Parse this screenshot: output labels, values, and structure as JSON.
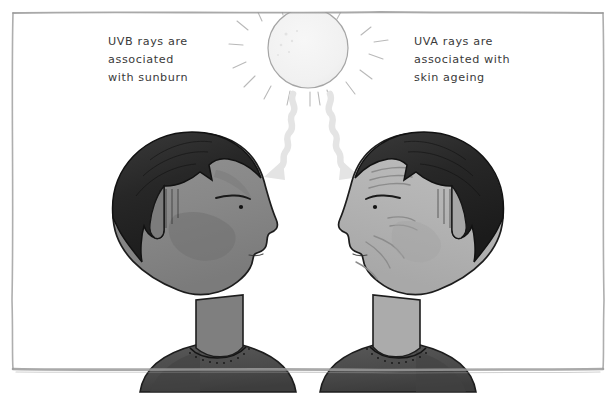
{
  "illustration": {
    "title": "UV rays and skin effects diagram",
    "background_color": "#ffffff",
    "frame": {
      "name": "hand-drawn-border",
      "color": "#9a9a9a"
    },
    "sun": {
      "name": "sun",
      "fill": "#f4f4f4",
      "outline": "#9a9a9a",
      "ray_count": 18
    },
    "uv_beams": {
      "color": "#e4e4e4",
      "count": 2
    },
    "captions": {
      "left": {
        "lines": [
          "UVB rays are",
          "associated",
          "with sunburn"
        ],
        "color": "#3a3a3a"
      },
      "right": {
        "lines": [
          "UVA rays are",
          "associated with",
          "skin ageing"
        ],
        "color": "#3a3a3a"
      }
    },
    "figures": [
      {
        "name": "left-person-sunburn",
        "facing": "right",
        "hair_color": "#2b2b2b",
        "skin_color": "#8a8a8a",
        "shirt_color": "#4a4a4a",
        "outline_color": "#1d1d1d",
        "condition": "sunburn"
      },
      {
        "name": "right-person-ageing",
        "facing": "left",
        "hair_color": "#2b2b2b",
        "skin_color": "#b6b6b6",
        "shirt_color": "#4a4a4a",
        "outline_color": "#1d1d1d",
        "condition": "skin ageing"
      }
    ]
  }
}
